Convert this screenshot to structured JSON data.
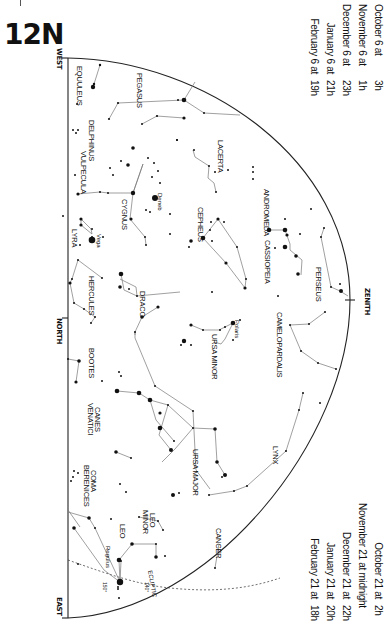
{
  "map": {
    "id": "12N",
    "directions": {
      "west": "WEST",
      "north": "NORTH",
      "east": "EAST",
      "zenith": "ZENITH"
    },
    "ecliptic_label": "ECLIPTIC",
    "ecliptic_marks": [
      "150°",
      "140°"
    ]
  },
  "times_top": [
    {
      "date": "October 6 at",
      "hour": "3h"
    },
    {
      "date": "November 6 at",
      "hour": "1h"
    },
    {
      "date": "December 6 at",
      "hour": "23h"
    },
    {
      "date": "January 6 at",
      "hour": "21h"
    },
    {
      "date": "February 6 at",
      "hour": "19h"
    }
  ],
  "times_bottom": [
    {
      "date": "October 21 at",
      "hour": "2h"
    },
    {
      "date": "November 21 at midnight",
      "hour": ""
    },
    {
      "date": "December 21 at",
      "hour": "22h"
    },
    {
      "date": "January 21 at",
      "hour": "20h"
    },
    {
      "date": "February 21 at",
      "hour": "18h"
    }
  ],
  "constellations": {
    "equuleus": "EQUULEUS",
    "pegasus": "PEGASUS",
    "delphinus": "DELPHINUS",
    "vulpecula": "VULPECULA",
    "lacerta": "LACERTA",
    "andromeda": "ANDROMEDA",
    "cygnus": "CYGNUS",
    "cepheus": "CEPHEUS",
    "cassiopeia": "CASSIOPEIA",
    "perseus": "PERSEUS",
    "lyra": "LYRA",
    "hercules": "HERCULES",
    "draco": "DRACO",
    "camelopardalis": "CAMELOPARDALIS",
    "ursa_minor": "URSA MINOR",
    "bootes": "BOOTES",
    "canes_venatici_1": "CANES",
    "canes_venatici_2": "VENATICI",
    "ursa_major": "URSA MAJOR",
    "lynx": "LYNX",
    "coma_berenices_1": "COMA",
    "coma_berenices_2": "BERENICES",
    "leo_minor_1": "LEO",
    "leo_minor_2": "MINOR",
    "leo": "LEO",
    "cancer": "CANCER"
  },
  "stars": {
    "deneb": "Deneb",
    "vega": "Vega",
    "polaris": "Polaris",
    "regulus": "Regulus"
  }
}
